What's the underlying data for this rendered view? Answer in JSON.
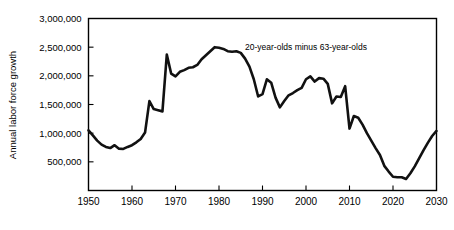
{
  "chart_data": {
    "type": "line",
    "title": "",
    "subtitle": "",
    "xlabel": "",
    "ylabel": "Annual labor force growth",
    "xlim": [
      1950,
      2030
    ],
    "ylim": [
      0,
      3000000
    ],
    "grid": false,
    "legend_position": "none",
    "annotations": [
      {
        "text": "20-year-olds minus 63-year-olds",
        "x": 2000,
        "y": 2450000
      }
    ],
    "xticks": [
      1950,
      1960,
      1970,
      1980,
      1990,
      2000,
      2010,
      2020,
      2030
    ],
    "xticklabels": [
      "1950",
      "1960",
      "1970",
      "1980",
      "1990",
      "2000",
      "2010",
      "2020",
      "2030"
    ],
    "yticks": [
      500000,
      1000000,
      1500000,
      2000000,
      2500000,
      3000000
    ],
    "yticklabels": [
      "500,000",
      "1,000,000",
      "1,500,000",
      "2,000,000",
      "2,500,000",
      "3,000,000"
    ],
    "series": [
      {
        "name": "20-year-olds minus 63-year-olds",
        "color": "#111111",
        "x": [
          1950,
          1951,
          1952,
          1953,
          1954,
          1955,
          1956,
          1957,
          1958,
          1959,
          1960,
          1961,
          1962,
          1963,
          1964,
          1965,
          1966,
          1967,
          1968,
          1969,
          1970,
          1971,
          1972,
          1973,
          1974,
          1975,
          1976,
          1977,
          1978,
          1979,
          1980,
          1981,
          1982,
          1983,
          1984,
          1985,
          1986,
          1987,
          1988,
          1989,
          1990,
          1991,
          1992,
          1993,
          1994,
          1995,
          1996,
          1997,
          1998,
          1999,
          2000,
          2001,
          2002,
          2003,
          2004,
          2005,
          2006,
          2007,
          2008,
          2009,
          2010,
          2011,
          2012,
          2013,
          2014,
          2015,
          2016,
          2017,
          2018,
          2019,
          2020,
          2021,
          2022,
          2023,
          2024,
          2025,
          2026,
          2027,
          2028,
          2029,
          2030
        ],
        "values": [
          1050000,
          960000,
          870000,
          800000,
          760000,
          740000,
          790000,
          730000,
          725000,
          760000,
          790000,
          840000,
          900000,
          1010000,
          1560000,
          1420000,
          1400000,
          1380000,
          2370000,
          2040000,
          1990000,
          2070000,
          2100000,
          2140000,
          2150000,
          2190000,
          2290000,
          2360000,
          2430000,
          2500000,
          2490000,
          2470000,
          2430000,
          2420000,
          2430000,
          2400000,
          2300000,
          2160000,
          1940000,
          1640000,
          1680000,
          1940000,
          1880000,
          1620000,
          1450000,
          1560000,
          1660000,
          1700000,
          1750000,
          1790000,
          1940000,
          1990000,
          1900000,
          1960000,
          1950000,
          1860000,
          1520000,
          1640000,
          1630000,
          1820000,
          1080000,
          1300000,
          1270000,
          1150000,
          1000000,
          870000,
          740000,
          620000,
          430000,
          330000,
          240000,
          230000,
          230000,
          200000,
          300000,
          420000,
          560000,
          700000,
          830000,
          950000,
          1040000
        ]
      }
    ]
  },
  "axis": {
    "y_title": "Annual labor force growth"
  }
}
